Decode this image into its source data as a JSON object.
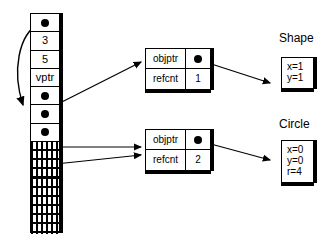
{
  "diagram": {
    "type": "object-reference-counting-diagram",
    "stack": {
      "name": "stack-column",
      "cells": [
        {
          "kind": "pointer",
          "label": ""
        },
        {
          "kind": "value",
          "label": "3"
        },
        {
          "kind": "value",
          "label": "5"
        },
        {
          "kind": "value",
          "label": "vptr"
        },
        {
          "kind": "pointer",
          "label": ""
        },
        {
          "kind": "pointer",
          "label": ""
        },
        {
          "kind": "pointer",
          "label": ""
        },
        {
          "kind": "hatched",
          "label": ""
        },
        {
          "kind": "hatched",
          "label": ""
        },
        {
          "kind": "hatched",
          "label": ""
        },
        {
          "kind": "hatched",
          "label": ""
        },
        {
          "kind": "hatched",
          "label": ""
        }
      ]
    },
    "handles": [
      {
        "name": "handle-box-1",
        "rows": [
          {
            "label": "objptr",
            "value": "",
            "value_kind": "pointer"
          },
          {
            "label": "refcnt",
            "value": "1",
            "value_kind": "number"
          }
        ]
      },
      {
        "name": "handle-box-2",
        "rows": [
          {
            "label": "objptr",
            "value": "",
            "value_kind": "pointer"
          },
          {
            "label": "refcnt",
            "value": "2",
            "value_kind": "number"
          }
        ]
      }
    ],
    "objects": [
      {
        "name": "shape-object",
        "title": "Shape",
        "fields": [
          "x=1",
          "y=1"
        ]
      },
      {
        "name": "circle-object",
        "title": "Circle",
        "fields": [
          "x=0",
          "y=0",
          "r=4"
        ]
      }
    ],
    "colors": {
      "ink": "#000000",
      "paper": "#ffffff"
    }
  }
}
